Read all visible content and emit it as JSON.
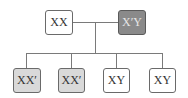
{
  "diagram": {
    "parents": [
      {
        "label": "XX",
        "fill": "#ffffff",
        "text_color": "#333333"
      },
      {
        "label": "X′Y",
        "fill": "#8a8a8a",
        "text_color": "#e6e6e6"
      }
    ],
    "children": [
      {
        "label": "XX′",
        "fill": "#d9d9d9"
      },
      {
        "label": "XX′",
        "fill": "#d9d9d9"
      },
      {
        "label": "XY",
        "fill": "#ffffff"
      },
      {
        "label": "XY",
        "fill": "#ffffff"
      }
    ]
  }
}
